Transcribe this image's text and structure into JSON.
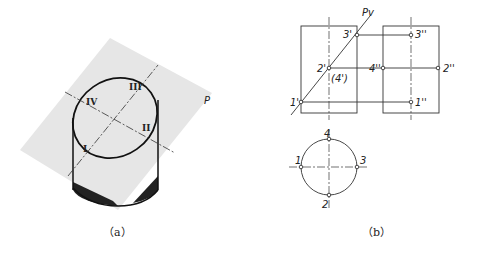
{
  "figure_a": {
    "caption": "（a）",
    "plane_label": "P",
    "points": [
      "I",
      "II",
      "III",
      "IV"
    ]
  },
  "figure_b": {
    "caption": "（b）",
    "trace_label": "Pv",
    "front_view_points": [
      "1'",
      "2'",
      "(4')",
      "3'"
    ],
    "side_view_points": [
      "1''",
      "2''",
      "3''",
      "4''"
    ],
    "top_view_points": [
      "1",
      "2",
      "3",
      "4"
    ]
  }
}
